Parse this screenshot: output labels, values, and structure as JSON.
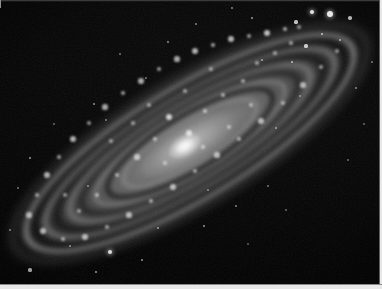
{
  "image": {
    "kind": "astronomical-photograph",
    "subject": "inclined spiral galaxy",
    "palette": "grayscale / monochrome",
    "background_color": "#000000",
    "frame_color": "#e8e8e8",
    "glow_color": "#ffffff",
    "caption": "",
    "width": 382,
    "height": 289
  },
  "galaxy": {
    "name": "",
    "position_angle_deg": -31,
    "core": {
      "x": 182,
      "y": 128,
      "brightness": "very-high"
    },
    "disc": {
      "major_axis_px": 372,
      "minor_axis_px": 96,
      "inclination": "highly-inclined"
    },
    "arm_count": 6,
    "dust_lane_count": 4
  },
  "knots": [
    {
      "x": 196,
      "y": 52,
      "r": 3.0,
      "o": 0.85
    },
    {
      "x": 214,
      "y": 46,
      "r": 2.4,
      "o": 0.8
    },
    {
      "x": 232,
      "y": 40,
      "r": 2.8,
      "o": 0.85
    },
    {
      "x": 250,
      "y": 37,
      "r": 2.2,
      "o": 0.75
    },
    {
      "x": 268,
      "y": 34,
      "r": 3.2,
      "o": 0.9
    },
    {
      "x": 286,
      "y": 30,
      "r": 2.4,
      "o": 0.8
    },
    {
      "x": 300,
      "y": 28,
      "r": 2.0,
      "o": 0.7
    },
    {
      "x": 178,
      "y": 60,
      "r": 2.6,
      "o": 0.8
    },
    {
      "x": 160,
      "y": 70,
      "r": 2.2,
      "o": 0.75
    },
    {
      "x": 142,
      "y": 82,
      "r": 2.8,
      "o": 0.82
    },
    {
      "x": 124,
      "y": 94,
      "r": 2.4,
      "o": 0.78
    },
    {
      "x": 106,
      "y": 108,
      "r": 2.6,
      "o": 0.8
    },
    {
      "x": 90,
      "y": 124,
      "r": 2.2,
      "o": 0.72
    },
    {
      "x": 74,
      "y": 140,
      "r": 3.0,
      "o": 0.85
    },
    {
      "x": 60,
      "y": 158,
      "r": 2.4,
      "o": 0.75
    },
    {
      "x": 48,
      "y": 176,
      "r": 2.8,
      "o": 0.8
    },
    {
      "x": 38,
      "y": 196,
      "r": 2.2,
      "o": 0.7
    },
    {
      "x": 30,
      "y": 216,
      "r": 2.6,
      "o": 0.75
    },
    {
      "x": 44,
      "y": 232,
      "r": 3.0,
      "o": 0.8
    },
    {
      "x": 64,
      "y": 240,
      "r": 2.4,
      "o": 0.75
    },
    {
      "x": 86,
      "y": 238,
      "r": 2.8,
      "o": 0.8
    },
    {
      "x": 108,
      "y": 228,
      "r": 2.2,
      "o": 0.72
    },
    {
      "x": 130,
      "y": 216,
      "r": 2.6,
      "o": 0.78
    },
    {
      "x": 152,
      "y": 202,
      "r": 2.4,
      "o": 0.75
    },
    {
      "x": 174,
      "y": 188,
      "r": 2.8,
      "o": 0.8
    },
    {
      "x": 196,
      "y": 172,
      "r": 2.2,
      "o": 0.72
    },
    {
      "x": 218,
      "y": 156,
      "r": 2.6,
      "o": 0.78
    },
    {
      "x": 240,
      "y": 140,
      "r": 2.4,
      "o": 0.74
    },
    {
      "x": 262,
      "y": 122,
      "r": 2.8,
      "o": 0.8
    },
    {
      "x": 284,
      "y": 104,
      "r": 2.2,
      "o": 0.7
    },
    {
      "x": 304,
      "y": 86,
      "r": 2.6,
      "o": 0.76
    },
    {
      "x": 322,
      "y": 68,
      "r": 2.4,
      "o": 0.72
    },
    {
      "x": 338,
      "y": 52,
      "r": 2.0,
      "o": 0.68
    },
    {
      "x": 170,
      "y": 118,
      "r": 3.4,
      "o": 0.95
    },
    {
      "x": 190,
      "y": 134,
      "r": 2.6,
      "o": 0.85
    },
    {
      "x": 156,
      "y": 140,
      "r": 2.2,
      "o": 0.75
    },
    {
      "x": 206,
      "y": 112,
      "r": 2.4,
      "o": 0.78
    },
    {
      "x": 138,
      "y": 158,
      "r": 2.6,
      "o": 0.76
    },
    {
      "x": 118,
      "y": 176,
      "r": 2.2,
      "o": 0.7
    },
    {
      "x": 224,
      "y": 96,
      "r": 2.4,
      "o": 0.76
    },
    {
      "x": 244,
      "y": 82,
      "r": 2.0,
      "o": 0.7
    },
    {
      "x": 98,
      "y": 196,
      "r": 2.4,
      "o": 0.72
    },
    {
      "x": 80,
      "y": 212,
      "r": 2.0,
      "o": 0.68
    },
    {
      "x": 258,
      "y": 64,
      "r": 2.2,
      "o": 0.72
    },
    {
      "x": 276,
      "y": 54,
      "r": 1.8,
      "o": 0.66
    },
    {
      "x": 204,
      "y": 148,
      "r": 2.0,
      "o": 0.7
    },
    {
      "x": 230,
      "y": 128,
      "r": 1.8,
      "o": 0.66
    },
    {
      "x": 150,
      "y": 106,
      "r": 2.0,
      "o": 0.7
    },
    {
      "x": 134,
      "y": 124,
      "r": 1.8,
      "o": 0.66
    },
    {
      "x": 292,
      "y": 44,
      "r": 2.2,
      "o": 0.74
    },
    {
      "x": 186,
      "y": 92,
      "r": 2.0,
      "o": 0.7
    },
    {
      "x": 112,
      "y": 142,
      "r": 1.8,
      "o": 0.64
    },
    {
      "x": 252,
      "y": 106,
      "r": 2.0,
      "o": 0.68
    },
    {
      "x": 66,
      "y": 196,
      "r": 2.2,
      "o": 0.7
    },
    {
      "x": 166,
      "y": 164,
      "r": 2.0,
      "o": 0.68
    },
    {
      "x": 212,
      "y": 70,
      "r": 1.8,
      "o": 0.64
    }
  ],
  "stars": [
    {
      "x": 330,
      "y": 14,
      "r": 3.2,
      "o": 1.0,
      "big": true
    },
    {
      "x": 312,
      "y": 12,
      "r": 2.4,
      "o": 0.95,
      "big": true
    },
    {
      "x": 350,
      "y": 18,
      "r": 1.8,
      "o": 0.8
    },
    {
      "x": 296,
      "y": 22,
      "r": 1.6,
      "o": 0.75
    },
    {
      "x": 322,
      "y": 34,
      "r": 1.4,
      "o": 0.7
    },
    {
      "x": 340,
      "y": 40,
      "r": 1.2,
      "o": 0.6
    },
    {
      "x": 306,
      "y": 46,
      "r": 1.6,
      "o": 0.75
    },
    {
      "x": 292,
      "y": 62,
      "r": 1.4,
      "o": 0.65
    },
    {
      "x": 252,
      "y": 18,
      "r": 1.2,
      "o": 0.6
    },
    {
      "x": 232,
      "y": 8,
      "r": 1.0,
      "o": 0.5
    },
    {
      "x": 196,
      "y": 24,
      "r": 1.0,
      "o": 0.5
    },
    {
      "x": 168,
      "y": 42,
      "r": 1.2,
      "o": 0.55
    },
    {
      "x": 120,
      "y": 54,
      "r": 1.0,
      "o": 0.45
    },
    {
      "x": 94,
      "y": 104,
      "r": 1.2,
      "o": 0.55
    },
    {
      "x": 106,
      "y": 120,
      "r": 1.0,
      "o": 0.45
    },
    {
      "x": 30,
      "y": 158,
      "r": 1.4,
      "o": 0.6
    },
    {
      "x": 18,
      "y": 188,
      "r": 1.0,
      "o": 0.45
    },
    {
      "x": 10,
      "y": 230,
      "r": 1.2,
      "o": 0.5
    },
    {
      "x": 30,
      "y": 270,
      "r": 1.6,
      "o": 0.7
    },
    {
      "x": 96,
      "y": 272,
      "r": 1.4,
      "o": 0.6
    },
    {
      "x": 110,
      "y": 252,
      "r": 2.0,
      "o": 0.85,
      "big": true
    },
    {
      "x": 142,
      "y": 260,
      "r": 1.2,
      "o": 0.55
    },
    {
      "x": 70,
      "y": 246,
      "r": 1.2,
      "o": 0.5
    },
    {
      "x": 204,
      "y": 226,
      "r": 1.4,
      "o": 0.6
    },
    {
      "x": 236,
      "y": 206,
      "r": 1.2,
      "o": 0.5
    },
    {
      "x": 268,
      "y": 186,
      "r": 1.0,
      "o": 0.45
    },
    {
      "x": 286,
      "y": 210,
      "r": 1.0,
      "o": 0.4
    },
    {
      "x": 248,
      "y": 244,
      "r": 1.0,
      "o": 0.35
    },
    {
      "x": 356,
      "y": 88,
      "r": 1.2,
      "o": 0.5
    },
    {
      "x": 364,
      "y": 124,
      "r": 1.0,
      "o": 0.4
    },
    {
      "x": 348,
      "y": 160,
      "r": 1.0,
      "o": 0.4
    },
    {
      "x": 372,
      "y": 62,
      "r": 1.0,
      "o": 0.45
    },
    {
      "x": 276,
      "y": 128,
      "r": 1.2,
      "o": 0.5
    },
    {
      "x": 208,
      "y": 190,
      "r": 1.0,
      "o": 0.45
    },
    {
      "x": 158,
      "y": 228,
      "r": 1.2,
      "o": 0.55
    },
    {
      "x": 88,
      "y": 186,
      "r": 1.0,
      "o": 0.45
    },
    {
      "x": 54,
      "y": 124,
      "r": 1.0,
      "o": 0.4
    },
    {
      "x": 146,
      "y": 78,
      "r": 1.0,
      "o": 0.45
    },
    {
      "x": 262,
      "y": 60,
      "r": 1.2,
      "o": 0.55
    },
    {
      "x": 300,
      "y": 96,
      "r": 1.0,
      "o": 0.45
    }
  ]
}
